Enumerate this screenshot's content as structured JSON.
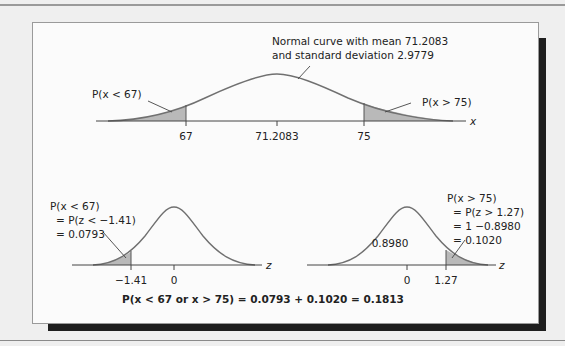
{
  "colors": {
    "page_background": "#efefef",
    "panel_background": "#fbfbfb",
    "curve": "#707070",
    "shaded_area": "#b9b9b9",
    "axis": "#444444",
    "shadow": "#1e1e1e"
  },
  "top_plot": {
    "annotation_line1": "Normal curve with mean 71.2083",
    "annotation_line2": "and standard deviation 2.9779",
    "left_area_label": "P(x < 67)",
    "right_area_label": "P(x > 75)",
    "axis_variable": "x",
    "ticks": [
      {
        "label": "67"
      },
      {
        "label": "71.2083"
      },
      {
        "label": "75"
      }
    ],
    "mean": 71.2083,
    "std_dev": 2.9779
  },
  "bottom_left_plot": {
    "line1": "P(x < 67)",
    "line2": "= P(z < −1.41)",
    "line3": "= 0.0793",
    "axis_variable": "z",
    "ticks": [
      {
        "label": "−1.41"
      },
      {
        "label": "0"
      }
    ]
  },
  "bottom_right_plot": {
    "center_label": "0.8980",
    "line1": "P(x > 75)",
    "line2": "= P(z > 1.27)",
    "line3": "= 1 −0.8980",
    "line4": "= 0.1020",
    "axis_variable": "z",
    "ticks": [
      {
        "label": "0"
      },
      {
        "label": "1.27"
      }
    ]
  },
  "summary": "P(x < 67 or x > 75) = 0.0793 + 0.1020 = 0.1813"
}
